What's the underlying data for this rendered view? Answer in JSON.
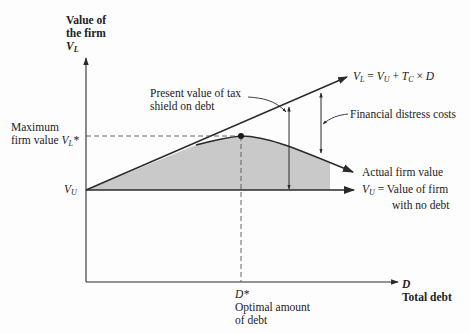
{
  "y_axis": {
    "label_line1": "Value of",
    "label_line2": "the firm",
    "symbol": "V",
    "symbol_sub": "L"
  },
  "x_axis": {
    "symbol": "D",
    "label": "Total debt"
  },
  "left_labels": {
    "max_line1": "Maximum",
    "max_line2": "firm value",
    "max_symbol": "V",
    "max_sub": "L",
    "max_star": "*",
    "vu_symbol": "V",
    "vu_sub": "U"
  },
  "annotations": {
    "tax_shield_line1": "Present value of tax",
    "tax_shield_line2": "shield on debt",
    "vl_eq_symbol": "V",
    "vl_eq_sub": "L",
    "vl_eq_mid": " = ",
    "vl_eq_vu": "V",
    "vl_eq_vu_sub": "U",
    "vl_eq_plus": " + ",
    "vl_eq_tc": "T",
    "vl_eq_tc_sub": "C",
    "vl_eq_times": " × ",
    "vl_eq_d": "D",
    "financial_distress": "Financial distress costs",
    "actual_value": "Actual firm value",
    "vu_def_symbol": "V",
    "vu_def_sub": "U",
    "vu_def_eq": " = ",
    "vu_def_line1": "Value of firm",
    "vu_def_line2": "with no debt",
    "dstar_symbol": "D",
    "dstar_star": "*",
    "optimal_line1": "Optimal amount",
    "optimal_line2": "of debt"
  },
  "colors": {
    "fill": "#c9c9c9",
    "line": "#2a2a2a",
    "background": "#fdfdfd"
  }
}
